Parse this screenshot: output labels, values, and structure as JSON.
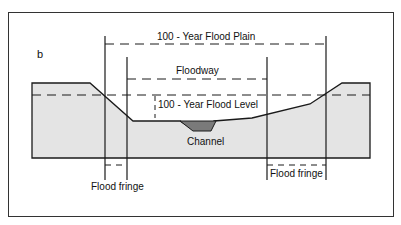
{
  "figure": {
    "panel_label": "b",
    "labels": {
      "flood_plain": "100 - Year Flood Plain",
      "floodway": "Floodway",
      "flood_level": "100 - Year Flood Level",
      "channel": "Channel",
      "flood_fringe_left": "Flood fringe",
      "flood_fringe_right": "Flood fringe"
    },
    "colors": {
      "terrain_fill": "#e4e4e4",
      "channel_fill": "#7a7a7a",
      "line": "#1a1a1a"
    }
  }
}
